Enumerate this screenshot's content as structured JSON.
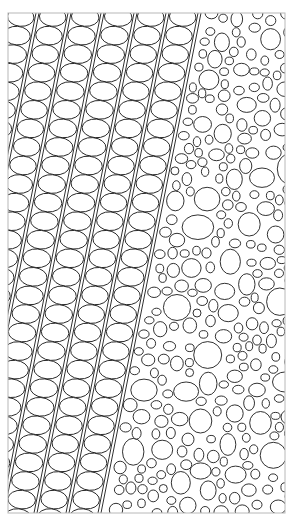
{
  "canvas": {
    "width": 293,
    "height": 530,
    "background": "#ffffff"
  },
  "frame": {
    "x": 8,
    "y": 13,
    "width": 277,
    "height": 500,
    "stroke": "#b8b8b8"
  },
  "ink": {
    "stroke": "#1a1a1a",
    "fill": "#ffffff"
  },
  "stripes": {
    "top_x": [
      36,
      68,
      101,
      134,
      166,
      198
    ],
    "slope_dx_per_dy": -0.2,
    "double_gap": 3,
    "oval_pitch": 32
  },
  "foam": {
    "seed": 7,
    "min_r": 4,
    "max_r": 15,
    "count": 900
  },
  "caption": {
    "text": ""
  }
}
